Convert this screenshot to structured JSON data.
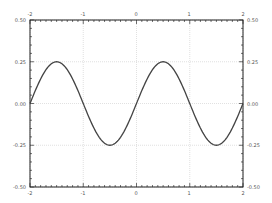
{
  "chart_data": {
    "type": "line",
    "title": "",
    "xlabel": "",
    "ylabel": "",
    "xlim": [
      -2,
      2
    ],
    "ylim": [
      -0.5,
      0.5
    ],
    "grid": true,
    "legend": null,
    "x_ticks": [
      "-2",
      "-1",
      "0",
      "1",
      "2"
    ],
    "y_ticks": [
      "-0.50",
      "-0.25",
      "0.00",
      "0.25",
      "0.50"
    ],
    "series": [
      {
        "name": "0.25*sin(pi*x)",
        "color": "#444444",
        "x": [
          -2,
          -1.75,
          -1.5,
          -1.25,
          -1,
          -0.75,
          -0.5,
          -0.25,
          0,
          0.25,
          0.5,
          0.75,
          1,
          1.25,
          1.5,
          1.75,
          2
        ],
        "y": [
          0,
          0.177,
          0.25,
          0.177,
          0,
          -0.177,
          -0.25,
          -0.177,
          0,
          0.177,
          0.25,
          0.177,
          0,
          -0.177,
          -0.25,
          -0.177,
          0
        ]
      }
    ]
  },
  "axes": {
    "bottom_labels": [
      "-2",
      "-1",
      "0",
      "1",
      "2"
    ],
    "top_labels": [
      "-2",
      "-1",
      "0",
      "1",
      "2"
    ],
    "left_labels": [
      "0.50",
      "0.25",
      "0.00",
      "-0.25",
      "-0.50"
    ],
    "right_labels": [
      "0.50",
      "0.25",
      "0.00",
      "-0.25",
      "-0.50"
    ]
  }
}
